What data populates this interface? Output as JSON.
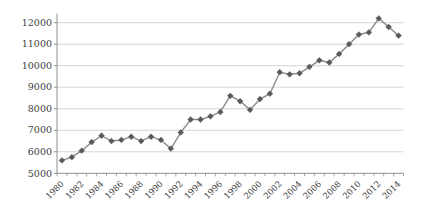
{
  "chart_data": {
    "type": "line",
    "title": "",
    "xlabel": "",
    "ylabel": "",
    "categories": [
      1980,
      1981,
      1982,
      1983,
      1984,
      1985,
      1986,
      1987,
      1988,
      1989,
      1990,
      1991,
      1992,
      1993,
      1994,
      1995,
      1996,
      1997,
      1998,
      1999,
      2000,
      2001,
      2002,
      2003,
      2004,
      2005,
      2006,
      2007,
      2008,
      2009,
      2010,
      2011,
      2012,
      2013,
      2014
    ],
    "values": [
      5600,
      5750,
      6050,
      6450,
      6750,
      6500,
      6550,
      6700,
      6500,
      6700,
      6550,
      6150,
      6900,
      7500,
      7500,
      7650,
      7850,
      8600,
      8350,
      7950,
      8450,
      8700,
      9700,
      9600,
      9650,
      9950,
      10250,
      10150,
      10550,
      11000,
      11450,
      11550,
      12200,
      11800,
      11400
    ],
    "ylim": [
      5000,
      12000
    ],
    "ytick_step": 1000,
    "ytick_labels": [
      "5000",
      "6000",
      "7000",
      "8000",
      "9000",
      "10000",
      "11000",
      "12000"
    ],
    "xtick_label_step": 2,
    "xtick_labels": [
      "1980",
      "1982",
      "1984",
      "1986",
      "1988",
      "1990",
      "1992",
      "1994",
      "1996",
      "1998",
      "2000",
      "2002",
      "2004",
      "2006",
      "2008",
      "2010",
      "2012",
      "2014"
    ],
    "grid": "horizontal",
    "legend": "none",
    "marker": "diamond",
    "colors": {
      "line": "#8c8c8c",
      "marker": "#595959",
      "gridline": "#c9c9c9",
      "axis": "#8f8f8f",
      "tick": "#8f8f8f",
      "label_text": "#404040",
      "background": "#ffffff"
    }
  }
}
